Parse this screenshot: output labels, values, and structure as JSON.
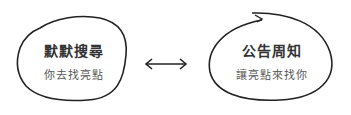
{
  "nodes": [
    {
      "title": "默默搜尋",
      "subtitle": "你去找亮點"
    },
    {
      "title": "公告周知",
      "subtitle": "讓亮點來找你"
    }
  ],
  "connector": {
    "type": "double-arrow"
  },
  "colors": {
    "stroke": "#222222",
    "background": "#ffffff"
  }
}
